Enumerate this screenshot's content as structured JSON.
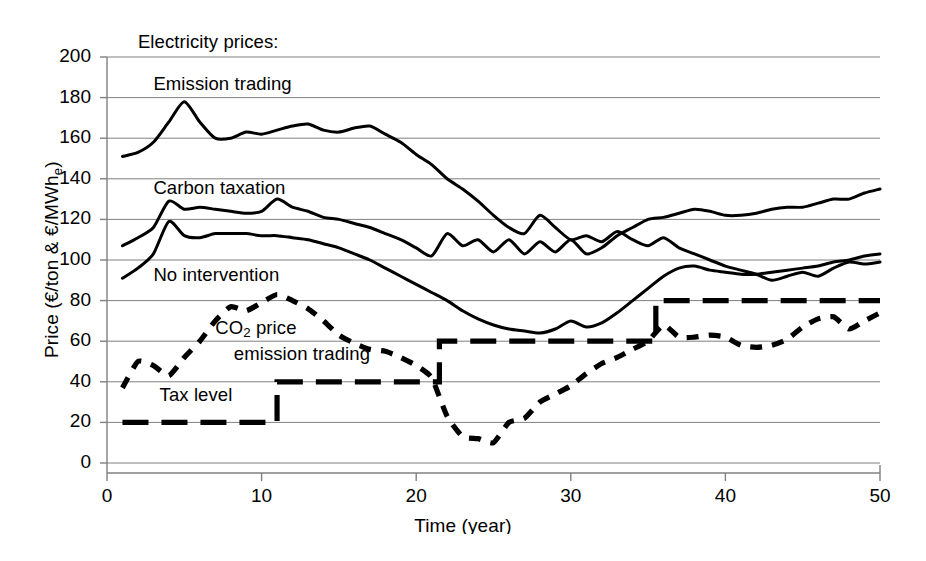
{
  "figure": {
    "width": 926,
    "height": 561,
    "background": "#ffffff",
    "line_color": "#000000",
    "grid_color": "#808080"
  },
  "chart_data": {
    "type": "line",
    "title": "",
    "xlabel": "Time (year)",
    "ylabel": "Price (€/ton & €/MWhₑ)",
    "ylabel_parts": {
      "prefix": "Price (€/ton & €/MWh",
      "subscript": "e",
      "suffix": ")"
    },
    "xlim": [
      0,
      50
    ],
    "ylim": [
      0,
      200
    ],
    "xticks": [
      0,
      10,
      20,
      30,
      40,
      50
    ],
    "yticks": [
      0,
      20,
      40,
      60,
      80,
      100,
      120,
      140,
      160,
      180,
      200
    ],
    "grid": "horizontal",
    "legend_position": "in-plot annotations",
    "annotations": [
      {
        "text": "Electricity prices:",
        "x": 2.0,
        "y": 207,
        "name": "electricity-prices-heading"
      },
      {
        "text": "Emission trading",
        "x": 3.0,
        "y": 186,
        "name": "emission-trading-label"
      },
      {
        "text": "Carbon taxation",
        "x": 3.0,
        "y": 135,
        "name": "carbon-taxation-label"
      },
      {
        "text": "No intervention",
        "x": 3.0,
        "y": 92,
        "name": "no-intervention-label"
      },
      {
        "text": "CO2 price",
        "x": 7.0,
        "y": 66,
        "name": "co2-price-label"
      },
      {
        "text": "emission trading",
        "x": 8.2,
        "y": 53,
        "name": "emission-trading-co2-label"
      },
      {
        "text": "Tax level",
        "x": 3.4,
        "y": 33,
        "name": "tax-level-label"
      }
    ],
    "x": [
      1,
      2,
      3,
      4,
      5,
      6,
      7,
      8,
      9,
      10,
      11,
      12,
      13,
      14,
      15,
      16,
      17,
      18,
      19,
      20,
      21,
      22,
      23,
      24,
      25,
      26,
      27,
      28,
      29,
      30,
      31,
      32,
      33,
      34,
      35,
      36,
      37,
      38,
      39,
      40,
      41,
      42,
      43,
      44,
      45,
      46,
      47,
      48,
      49,
      50
    ],
    "series": [
      {
        "name": "Emission trading",
        "style": "solid",
        "values": [
          151,
          153,
          158,
          168,
          178,
          168,
          160,
          160,
          163,
          162,
          164,
          166,
          167,
          164,
          163,
          165,
          166,
          162,
          158,
          152,
          147,
          140,
          135,
          129,
          122,
          116,
          113,
          122,
          116,
          110,
          112,
          109,
          114,
          110,
          107,
          111,
          106,
          103,
          100,
          97,
          95,
          93,
          90,
          92,
          94,
          92,
          96,
          99,
          98,
          99
        ]
      },
      {
        "name": "Carbon taxation",
        "style": "solid",
        "values": [
          107,
          111,
          116,
          129,
          125,
          126,
          125,
          124,
          123,
          124,
          130,
          126,
          124,
          121,
          120,
          118,
          116,
          113,
          110,
          106,
          102,
          113,
          107,
          110,
          104,
          110,
          103,
          109,
          104,
          110,
          103,
          106,
          112,
          116,
          120,
          121,
          123,
          125,
          124,
          122,
          122,
          123,
          125,
          126,
          126,
          128,
          130,
          130,
          133,
          135
        ]
      },
      {
        "name": "No intervention",
        "style": "solid",
        "values": [
          91,
          96,
          103,
          119,
          112,
          111,
          113,
          113,
          113,
          112,
          112,
          111,
          110,
          108,
          106,
          103,
          100,
          96,
          92,
          88,
          84,
          80,
          75,
          71,
          68,
          66,
          65,
          64,
          66,
          70,
          67,
          69,
          74,
          80,
          86,
          92,
          96,
          97,
          95,
          94,
          93,
          93,
          94,
          95,
          96,
          97,
          99,
          100,
          102,
          103
        ]
      },
      {
        "name": "CO2 price emission trading",
        "style": "dashed",
        "values": [
          37,
          50,
          48,
          43,
          52,
          60,
          70,
          77,
          75,
          79,
          83,
          80,
          76,
          70,
          63,
          59,
          56,
          55,
          52,
          48,
          42,
          23,
          13,
          12,
          10,
          20,
          22,
          30,
          34,
          38,
          44,
          49,
          52,
          56,
          60,
          68,
          62,
          62,
          63,
          62,
          58,
          57,
          58,
          61,
          67,
          71,
          72,
          66,
          70,
          74
        ]
      },
      {
        "name": "Tax level",
        "style": "dashed-step",
        "step_points": [
          {
            "from_year": 1,
            "to_year": 11,
            "value": 20
          },
          {
            "from_year": 11,
            "to_year": 21.5,
            "value": 40
          },
          {
            "from_year": 21.5,
            "to_year": 35.5,
            "value": 60
          },
          {
            "from_year": 35.5,
            "to_year": 50,
            "value": 80
          }
        ]
      }
    ]
  }
}
